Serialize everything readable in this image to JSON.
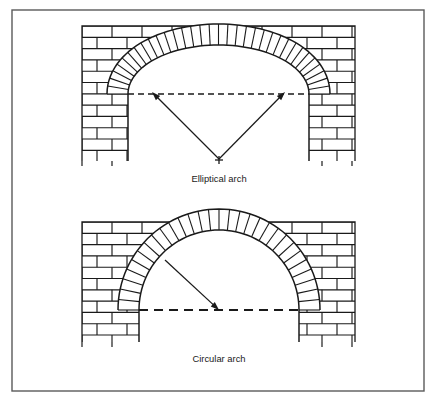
{
  "figure": {
    "title": "",
    "background_color": "#ffffff",
    "border": {
      "name": "figure-border",
      "x": 12,
      "y": 10,
      "width": 412,
      "height": 381,
      "color": "#5a5a5a",
      "line_width": 1.4
    },
    "ink_color": "#1a1a1a",
    "brick_color": "#1a1a1a"
  },
  "panels": [
    {
      "id": "elliptical",
      "label": "Elliptical arch",
      "label_x": 219,
      "label_y": 182,
      "arch_type": "elliptical",
      "wall": {
        "x": 82,
        "y": 26,
        "width": 273,
        "height": 135,
        "course_height": 11.3,
        "brick_width": 30,
        "ticks": true
      },
      "opening": {
        "left": 128,
        "right": 309,
        "springing_y": 94,
        "bottom_y": 161,
        "crown_rise": 49,
        "ring_thickness": 21,
        "voussoir_count": 34
      },
      "springing_line": {
        "name": "springing-line",
        "x1": 128,
        "x2": 309,
        "y": 94,
        "dash": "6,4",
        "width": 1.3
      },
      "radii": [
        {
          "name": "radius-arrow-left",
          "from_x": 219,
          "from_y": 159,
          "to_x": 152,
          "to_y": 92,
          "arrow": true
        },
        {
          "name": "radius-arrow-right",
          "from_x": 219,
          "from_y": 159,
          "to_x": 285,
          "to_y": 92,
          "arrow": true
        }
      ],
      "center_marks": [
        {
          "name": "center-cross",
          "x": 219,
          "y": 160,
          "size": 4
        }
      ]
    },
    {
      "id": "circular",
      "label": "Circular arch",
      "label_x": 219,
      "label_y": 362,
      "arch_type": "circular",
      "wall": {
        "x": 82,
        "y": 222,
        "width": 273,
        "height": 120,
        "course_height": 11.3,
        "brick_width": 30,
        "ticks": true
      },
      "opening": {
        "left": 139,
        "right": 299,
        "springing_y": 310,
        "bottom_y": 342,
        "crown_rise": 80,
        "ring_thickness": 21,
        "voussoir_count": 30
      },
      "springing_line": {
        "name": "springing-line",
        "x1": 139,
        "x2": 299,
        "y": 310,
        "dash": "9,6",
        "width": 2.2
      },
      "radii": [
        {
          "name": "radius-arrow",
          "from_x": 165,
          "from_y": 260,
          "to_x": 219,
          "to_y": 310,
          "arrow": true
        }
      ],
      "center_marks": []
    }
  ]
}
